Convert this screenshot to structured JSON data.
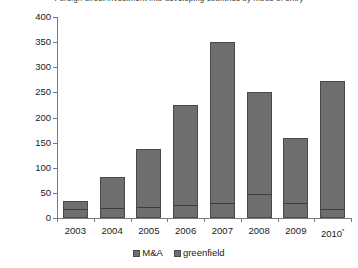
{
  "chart_data": {
    "type": "bar",
    "title": "Foreign direct investment into developing countries by mode of entry",
    "xlabel": "",
    "ylabel": "$ billions",
    "categories": [
      "2003",
      "2004",
      "2005",
      "2006",
      "2007",
      "2008",
      "2009",
      "2010*"
    ],
    "series": [
      {
        "name": "M&A",
        "values": [
          18,
          20,
          22,
          26,
          30,
          48,
          30,
          17
        ],
        "color": "#6e6e6e"
      },
      {
        "name": "greenfield",
        "values": [
          15,
          62,
          116,
          199,
          320,
          202,
          130,
          255
        ],
        "color": "#6e6e6e"
      }
    ],
    "totals": [
      33,
      82,
      138,
      225,
      350,
      250,
      160,
      272
    ],
    "stacked": true,
    "ylim": [
      0,
      400
    ],
    "yticks": [
      0,
      50,
      100,
      150,
      200,
      250,
      300,
      350,
      400
    ],
    "ytick_labels": [
      "0",
      "50",
      "100",
      "150",
      "200",
      "250",
      "300",
      "350",
      "400"
    ],
    "grid": false,
    "legend_position": "bottom",
    "footnote_marker": "*"
  },
  "axes": {
    "y_title": "$ billions"
  },
  "legend": {
    "entries": [
      {
        "label": "M&A"
      },
      {
        "label": "greenfield"
      }
    ]
  }
}
